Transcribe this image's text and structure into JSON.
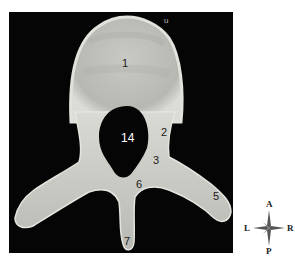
{
  "image": {
    "subject": "vertebra, superior view",
    "background_color": "#050505",
    "bone_color": "#cfcfc9"
  },
  "labels": [
    {
      "id": "1",
      "text": "1"
    },
    {
      "id": "2",
      "text": "2"
    },
    {
      "id": "3",
      "text": "3"
    },
    {
      "id": "5",
      "text": "5"
    },
    {
      "id": "6",
      "text": "6"
    },
    {
      "id": "7",
      "text": "7"
    },
    {
      "id": "14",
      "text": "14"
    }
  ],
  "corner_mark": "u",
  "compass": {
    "top": "A",
    "bottom": "P",
    "left": "L",
    "right": "R"
  }
}
